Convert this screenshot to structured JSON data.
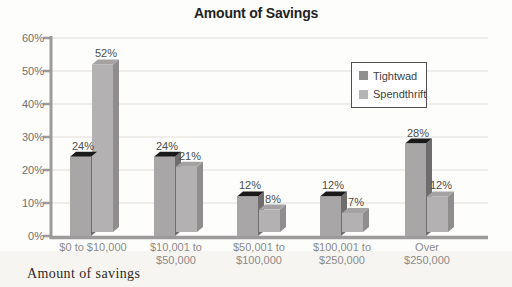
{
  "title": "Amount of Savings",
  "caption": "Amount of savings",
  "legend": {
    "items": [
      {
        "label": "Tightwad",
        "color": "#8f8f8f"
      },
      {
        "label": "Spendthrift",
        "color": "#b5b5b5"
      }
    ]
  },
  "chart_data": {
    "type": "bar",
    "title": "Amount of Savings",
    "xlabel": "Amount of savings",
    "ylabel": "",
    "ylim": [
      0,
      60
    ],
    "ytick_labels": [
      "0%",
      "10%",
      "20%",
      "30%",
      "40%",
      "50%",
      "60%"
    ],
    "grid": true,
    "legend_position": "upper right",
    "categories": [
      "$0 to $10,000",
      "$10,001 to $50,000",
      "$50,001 to $100,000",
      "$100,001 to $250,000",
      "Over $250,000"
    ],
    "category_lines": [
      [
        "$0 to $10,000"
      ],
      [
        "$10,001 to",
        "$50,000"
      ],
      [
        "$50,001 to",
        "$100,000"
      ],
      [
        "$100,001 to",
        "$250,000"
      ],
      [
        "Over",
        "$250,000"
      ]
    ],
    "series": [
      {
        "name": "Tightwad",
        "values": [
          24,
          24,
          12,
          12,
          28
        ],
        "value_labels": [
          "24%",
          "24%",
          "12%",
          "12%",
          "28%"
        ],
        "colors": {
          "front": "#a8a6a6",
          "side": "#6e6c6c",
          "top": "#1a1a1a"
        }
      },
      {
        "name": "Spendthrift",
        "values": [
          52,
          21,
          8,
          7,
          12
        ],
        "value_labels": [
          "52%",
          "21%",
          "8%",
          "7%",
          "12%"
        ],
        "colors": {
          "front": "#b3b1b1",
          "side": "#8f8d8d",
          "top": "#a4a2a2"
        }
      }
    ],
    "style": {
      "axis_color": "#9c9a9a",
      "grid_color": "#eae7e4",
      "tick_label_color": "#6f6f6f",
      "category_label_color": "#8c8a8a",
      "value_label_color": "#4d4d4d"
    }
  }
}
